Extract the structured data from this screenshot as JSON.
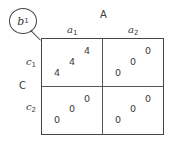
{
  "diagram": {
    "branch_node": {
      "label": "b",
      "sub": "1"
    },
    "col_factor": {
      "label": "A"
    },
    "row_factor": {
      "label": "C"
    },
    "columns": [
      {
        "label": "a",
        "sub": "1"
      },
      {
        "label": "a",
        "sub": "2"
      }
    ],
    "rows": [
      {
        "label": "c",
        "sub": "1"
      },
      {
        "label": "c",
        "sub": "2"
      }
    ],
    "cells": [
      [
        "4",
        "4",
        "4"
      ],
      [
        "0",
        "0",
        "0"
      ],
      [
        "0",
        "0",
        "0"
      ],
      [
        "0",
        "0",
        "0"
      ]
    ]
  }
}
